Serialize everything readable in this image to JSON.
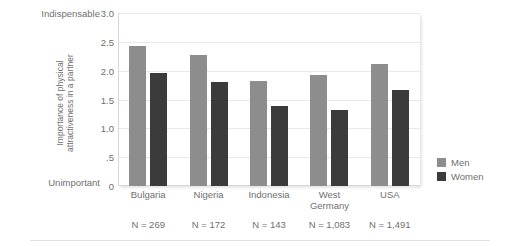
{
  "chart_data": {
    "type": "bar",
    "title": "",
    "xlabel": "",
    "ylabel": "Importance of physical attractiveness in a partner",
    "ylabel_line1": "Importance of physical",
    "ylabel_line2": "attractiveness in a partner",
    "ylim": [
      0,
      3.0
    ],
    "yticks": [
      "0",
      ".5",
      "1.0",
      "1.5",
      "2.0",
      "2.5",
      "3.0"
    ],
    "ytick_values": [
      0,
      0.5,
      1.0,
      1.5,
      2.0,
      2.5,
      3.0
    ],
    "axis_anchor_high": "Indispensable",
    "axis_anchor_low": "Unimportant",
    "grid": true,
    "legend_position": "right",
    "categories": [
      "Bulgaria",
      "Nigeria",
      "Indonesia",
      "West Germany",
      "USA"
    ],
    "category_lines": [
      [
        "Bulgaria"
      ],
      [
        "Nigeria"
      ],
      [
        "Indonesia"
      ],
      [
        "West",
        "Germany"
      ],
      [
        "USA"
      ]
    ],
    "sample_sizes": [
      "N = 269",
      "N = 172",
      "N = 143",
      "N = 1,083",
      "N = 1,491"
    ],
    "series": [
      {
        "name": "Men",
        "color": "#8d8d8d",
        "values": [
          2.42,
          2.27,
          1.82,
          1.92,
          2.11
        ]
      },
      {
        "name": "Women",
        "color": "#3b3b3b",
        "values": [
          1.96,
          1.81,
          1.38,
          1.32,
          1.67
        ]
      }
    ]
  },
  "colors": {
    "men": "#8d8d8d",
    "women": "#3b3b3b",
    "text": "#6f6f6f",
    "grid": "#e9e9e9",
    "background": "#ffffff"
  }
}
